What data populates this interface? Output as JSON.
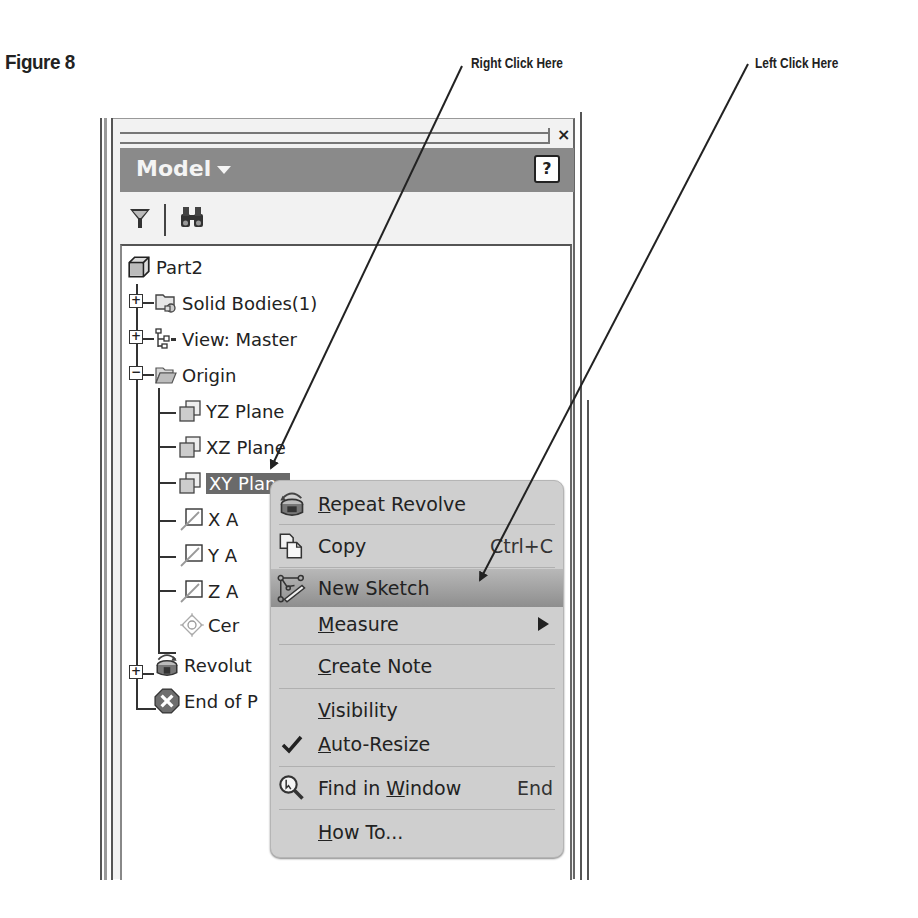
{
  "figure": {
    "title": "Figure 8",
    "callouts": {
      "right_click": "Right Click Here",
      "left_click": "Left Click Here"
    }
  },
  "panel": {
    "title": "Model",
    "close_label": "×",
    "help_label": "?",
    "toolbar": {
      "filter_icon": "filter-icon",
      "find_icon": "binoculars-icon"
    }
  },
  "tree": {
    "items": [
      {
        "label": "Part2",
        "icon": "part-cube-icon",
        "expander": null
      },
      {
        "label": "Solid Bodies(1)",
        "icon": "solid-bodies-icon",
        "expander": "+"
      },
      {
        "label": "View: Master",
        "icon": "view-rep-icon",
        "expander": "+"
      },
      {
        "label": "Origin",
        "icon": "folder-open-icon",
        "expander": "−"
      },
      {
        "label": "YZ Plane",
        "icon": "plane-icon",
        "expander": null
      },
      {
        "label": "XZ Plane",
        "icon": "plane-icon",
        "expander": null
      },
      {
        "label": "XY Plane",
        "icon": "plane-icon",
        "expander": null,
        "selected": true
      },
      {
        "label": "X A",
        "icon": "axis-icon",
        "expander": null
      },
      {
        "label": "Y A",
        "icon": "axis-icon",
        "expander": null
      },
      {
        "label": "Z A",
        "icon": "axis-icon",
        "expander": null
      },
      {
        "label": "Cer",
        "icon": "center-point-icon",
        "expander": null
      },
      {
        "label": "Revolut",
        "icon": "revolve-icon",
        "expander": "+"
      },
      {
        "label": "End of P",
        "icon": "end-of-part-icon",
        "expander": null
      }
    ]
  },
  "context_menu": {
    "items": [
      {
        "label": "Repeat Revolve",
        "underline": "R",
        "rest": "epeat Revolve",
        "icon": "revolve-icon",
        "shortcut": ""
      },
      {
        "label": "Copy",
        "underline": "",
        "rest": "Copy",
        "icon": "copy-icon",
        "shortcut": "Ctrl+C"
      },
      {
        "label": "New Sketch",
        "underline": "",
        "rest": "New Sketch",
        "icon": "new-sketch-icon",
        "shortcut": "",
        "highlighted": true
      },
      {
        "label": "Measure",
        "underline": "M",
        "rest": "easure",
        "icon": "",
        "shortcut": "",
        "submenu": true
      },
      {
        "label": "Create Note",
        "underline": "C",
        "rest": "reate Note",
        "icon": "",
        "shortcut": ""
      },
      {
        "label": "Visibility",
        "underline": "V",
        "rest": "isibility",
        "icon": "",
        "shortcut": ""
      },
      {
        "label": "Auto-Resize",
        "underline": "A",
        "rest": "uto-Resize",
        "icon": "checkmark-icon",
        "shortcut": "",
        "checked": true
      },
      {
        "label": "Find in Window",
        "pre": "Find in ",
        "underline": "W",
        "rest": "indow",
        "icon": "find-in-window-icon",
        "shortcut": "End"
      },
      {
        "label": "How To...",
        "underline": "H",
        "rest": "ow To...",
        "icon": "",
        "shortcut": ""
      }
    ]
  },
  "colors": {
    "header_bar": "#8a8a8a",
    "menu_bg": "#cfcfcf",
    "selection": "#6a6a6a"
  }
}
